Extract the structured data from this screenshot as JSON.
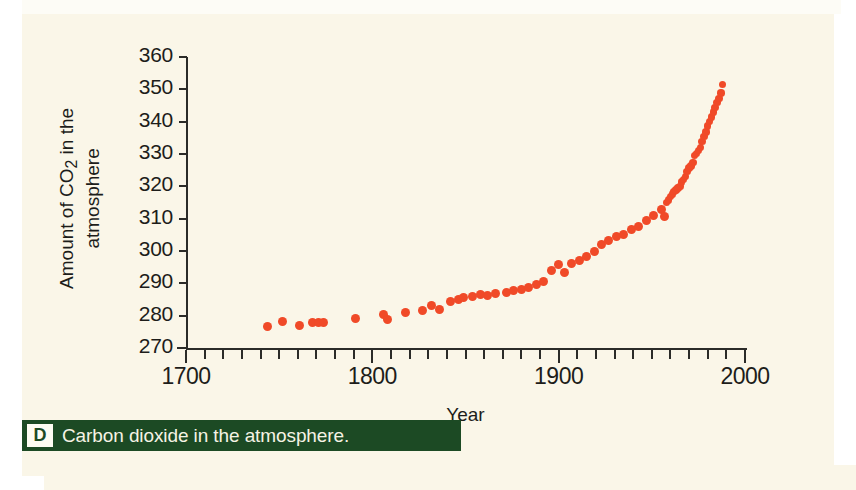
{
  "figure": {
    "caption_letter": "D",
    "caption_text": "Carbon dioxide in the atmosphere."
  },
  "colors": {
    "dot": "#f04a28",
    "axis": "#2b2b28",
    "panel_background": "#faf6e8",
    "caption_bar": "#1c4a24",
    "caption_text": "#f6f3e4"
  },
  "chart_data": {
    "type": "scatter",
    "title": "",
    "xlabel": "Year",
    "ylabel": "Amount of CO2 in the atmosphere",
    "ylabel_lines": [
      "Amount of CO₂ in the",
      "atmosphere"
    ],
    "xlim": [
      1700,
      2000
    ],
    "ylim": [
      270,
      360
    ],
    "x_ticks_major": [
      1700,
      1800,
      1900,
      2000
    ],
    "x_tick_labels": [
      "1700",
      "1800",
      "1900",
      "2000"
    ],
    "x_tick_minor_step": 10,
    "y_ticks": [
      270,
      280,
      290,
      300,
      310,
      320,
      330,
      340,
      350,
      360
    ],
    "y_tick_labels": [
      "270",
      "280",
      "290",
      "300",
      "310",
      "320",
      "330",
      "340",
      "350",
      "360"
    ],
    "grid": false,
    "legend": null,
    "series": [
      {
        "name": "Atmospheric CO2 (ppm)",
        "color": "#f04a28",
        "points": [
          [
            1744,
            276.8
          ],
          [
            1752,
            278.3
          ],
          [
            1761,
            277.0
          ],
          [
            1768,
            277.8
          ],
          [
            1771,
            277.9
          ],
          [
            1774,
            277.9
          ],
          [
            1791,
            279.0
          ],
          [
            1806,
            280.5
          ],
          [
            1808,
            278.8
          ],
          [
            1818,
            281.0
          ],
          [
            1827,
            281.5
          ],
          [
            1832,
            283.2
          ],
          [
            1836,
            281.8
          ],
          [
            1842,
            284.5
          ],
          [
            1846,
            285.0
          ],
          [
            1849,
            285.5
          ],
          [
            1854,
            286.0
          ],
          [
            1858,
            286.4
          ],
          [
            1862,
            286.2
          ],
          [
            1866,
            287.0
          ],
          [
            1872,
            287.2
          ],
          [
            1876,
            287.8
          ],
          [
            1880,
            288.0
          ],
          [
            1884,
            288.6
          ],
          [
            1888,
            289.6
          ],
          [
            1892,
            290.6
          ],
          [
            1896,
            294.0
          ],
          [
            1900,
            295.8
          ],
          [
            1903,
            293.5
          ],
          [
            1907,
            296.0
          ],
          [
            1911,
            297.0
          ],
          [
            1915,
            298.2
          ],
          [
            1919,
            300.0
          ],
          [
            1923,
            302.0
          ],
          [
            1927,
            303.2
          ],
          [
            1931,
            304.5
          ],
          [
            1935,
            305.0
          ],
          [
            1939,
            306.5
          ],
          [
            1943,
            307.5
          ],
          [
            1947,
            309.5
          ],
          [
            1951,
            311.0
          ],
          [
            1955,
            312.8
          ],
          [
            1957,
            310.8
          ],
          [
            1958,
            315.0
          ],
          [
            1959,
            315.8
          ],
          [
            1960,
            316.9
          ],
          [
            1961,
            317.6
          ],
          [
            1962,
            318.4
          ],
          [
            1963,
            318.9
          ],
          [
            1964,
            319.5
          ],
          [
            1965,
            320.0
          ],
          [
            1966,
            321.4
          ],
          [
            1967,
            322.1
          ],
          [
            1968,
            323.0
          ],
          [
            1969,
            324.6
          ],
          [
            1970,
            325.6
          ],
          [
            1971,
            326.3
          ],
          [
            1972,
            327.4
          ],
          [
            1973,
            329.6
          ],
          [
            1974,
            330.2
          ],
          [
            1975,
            331.1
          ],
          [
            1976,
            332.0
          ],
          [
            1977,
            333.8
          ],
          [
            1978,
            335.4
          ],
          [
            1979,
            336.8
          ],
          [
            1980,
            338.7
          ],
          [
            1981,
            340.1
          ],
          [
            1982,
            341.4
          ],
          [
            1983,
            343.0
          ],
          [
            1984,
            344.4
          ],
          [
            1985,
            345.9
          ],
          [
            1986,
            347.2
          ],
          [
            1987,
            348.9
          ],
          [
            1988,
            351.5
          ]
        ]
      }
    ]
  }
}
